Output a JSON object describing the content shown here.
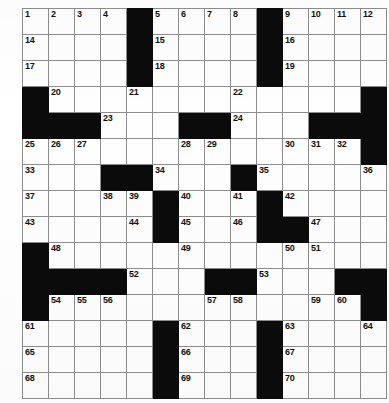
{
  "puzzle": {
    "title": "Crossword Puzzle Grid",
    "type": "crossword",
    "rows": 15,
    "cols": 14,
    "colors": {
      "block": "#0b0b0b",
      "cell": "#fefefe",
      "grid_line": "#8d8d8d",
      "outer_border": "#3a3a3a",
      "number_text": "#101010"
    },
    "max_clue_number": 70,
    "grid": [
      {
        "row": 1,
        "cells": [
          {
            "type": "open",
            "number": "1"
          },
          {
            "type": "open",
            "number": "2"
          },
          {
            "type": "open",
            "number": "3"
          },
          {
            "type": "open",
            "number": "4"
          },
          {
            "type": "block",
            "number": ""
          },
          {
            "type": "open",
            "number": "5"
          },
          {
            "type": "open",
            "number": "6"
          },
          {
            "type": "open",
            "number": "7"
          },
          {
            "type": "open",
            "number": "8"
          },
          {
            "type": "block",
            "number": ""
          },
          {
            "type": "open",
            "number": "9"
          },
          {
            "type": "open",
            "number": "10"
          },
          {
            "type": "open",
            "number": "11"
          },
          {
            "type": "open",
            "number": "12"
          }
        ]
      },
      {
        "row": 2,
        "cells": [
          {
            "type": "open",
            "number": "14"
          },
          {
            "type": "open",
            "number": ""
          },
          {
            "type": "open",
            "number": ""
          },
          {
            "type": "open",
            "number": ""
          },
          {
            "type": "block",
            "number": ""
          },
          {
            "type": "open",
            "number": "15"
          },
          {
            "type": "open",
            "number": ""
          },
          {
            "type": "open",
            "number": ""
          },
          {
            "type": "open",
            "number": ""
          },
          {
            "type": "block",
            "number": ""
          },
          {
            "type": "open",
            "number": "16"
          },
          {
            "type": "open",
            "number": ""
          },
          {
            "type": "open",
            "number": ""
          },
          {
            "type": "open",
            "number": ""
          }
        ]
      },
      {
        "row": 3,
        "cells": [
          {
            "type": "open",
            "number": "17"
          },
          {
            "type": "open",
            "number": ""
          },
          {
            "type": "open",
            "number": ""
          },
          {
            "type": "open",
            "number": ""
          },
          {
            "type": "block",
            "number": ""
          },
          {
            "type": "open",
            "number": "18"
          },
          {
            "type": "open",
            "number": ""
          },
          {
            "type": "open",
            "number": ""
          },
          {
            "type": "open",
            "number": ""
          },
          {
            "type": "block",
            "number": ""
          },
          {
            "type": "open",
            "number": "19"
          },
          {
            "type": "open",
            "number": ""
          },
          {
            "type": "open",
            "number": ""
          },
          {
            "type": "open",
            "number": ""
          }
        ]
      },
      {
        "row": 4,
        "cells": [
          {
            "type": "block",
            "number": ""
          },
          {
            "type": "open",
            "number": "20"
          },
          {
            "type": "open",
            "number": ""
          },
          {
            "type": "open",
            "number": ""
          },
          {
            "type": "open",
            "number": "21"
          },
          {
            "type": "open",
            "number": ""
          },
          {
            "type": "open",
            "number": ""
          },
          {
            "type": "open",
            "number": ""
          },
          {
            "type": "open",
            "number": "22"
          },
          {
            "type": "open",
            "number": ""
          },
          {
            "type": "open",
            "number": ""
          },
          {
            "type": "open",
            "number": ""
          },
          {
            "type": "open",
            "number": ""
          },
          {
            "type": "block",
            "number": ""
          }
        ]
      },
      {
        "row": 5,
        "cells": [
          {
            "type": "block",
            "number": ""
          },
          {
            "type": "block",
            "number": ""
          },
          {
            "type": "block",
            "number": ""
          },
          {
            "type": "open",
            "number": "23"
          },
          {
            "type": "open",
            "number": ""
          },
          {
            "type": "open",
            "number": ""
          },
          {
            "type": "block",
            "number": ""
          },
          {
            "type": "block",
            "number": ""
          },
          {
            "type": "open",
            "number": "24"
          },
          {
            "type": "open",
            "number": ""
          },
          {
            "type": "open",
            "number": ""
          },
          {
            "type": "block",
            "number": ""
          },
          {
            "type": "block",
            "number": ""
          },
          {
            "type": "block",
            "number": ""
          }
        ]
      },
      {
        "row": 6,
        "cells": [
          {
            "type": "open",
            "number": "25"
          },
          {
            "type": "open",
            "number": "26"
          },
          {
            "type": "open",
            "number": "27"
          },
          {
            "type": "open",
            "number": ""
          },
          {
            "type": "open",
            "number": ""
          },
          {
            "type": "open",
            "number": ""
          },
          {
            "type": "open",
            "number": "28"
          },
          {
            "type": "open",
            "number": "29"
          },
          {
            "type": "open",
            "number": ""
          },
          {
            "type": "open",
            "number": ""
          },
          {
            "type": "open",
            "number": "30"
          },
          {
            "type": "open",
            "number": "31"
          },
          {
            "type": "open",
            "number": "32"
          },
          {
            "type": "block",
            "number": ""
          }
        ]
      },
      {
        "row": 7,
        "cells": [
          {
            "type": "open",
            "number": "33"
          },
          {
            "type": "open",
            "number": ""
          },
          {
            "type": "open",
            "number": ""
          },
          {
            "type": "block",
            "number": ""
          },
          {
            "type": "block",
            "number": ""
          },
          {
            "type": "open",
            "number": "34"
          },
          {
            "type": "open",
            "number": ""
          },
          {
            "type": "open",
            "number": ""
          },
          {
            "type": "block",
            "number": ""
          },
          {
            "type": "open",
            "number": "35"
          },
          {
            "type": "open",
            "number": ""
          },
          {
            "type": "open",
            "number": ""
          },
          {
            "type": "open",
            "number": ""
          },
          {
            "type": "open",
            "number": "36"
          }
        ]
      },
      {
        "row": 8,
        "cells": [
          {
            "type": "open",
            "number": "37"
          },
          {
            "type": "open",
            "number": ""
          },
          {
            "type": "open",
            "number": ""
          },
          {
            "type": "open",
            "number": "38"
          },
          {
            "type": "open",
            "number": "39"
          },
          {
            "type": "block",
            "number": ""
          },
          {
            "type": "open",
            "number": "40"
          },
          {
            "type": "open",
            "number": ""
          },
          {
            "type": "open",
            "number": "41"
          },
          {
            "type": "block",
            "number": ""
          },
          {
            "type": "open",
            "number": "42"
          },
          {
            "type": "open",
            "number": ""
          },
          {
            "type": "open",
            "number": ""
          },
          {
            "type": "open",
            "number": ""
          }
        ]
      },
      {
        "row": 9,
        "cells": [
          {
            "type": "open",
            "number": "43"
          },
          {
            "type": "open",
            "number": ""
          },
          {
            "type": "open",
            "number": ""
          },
          {
            "type": "open",
            "number": ""
          },
          {
            "type": "open",
            "number": "44"
          },
          {
            "type": "block",
            "number": ""
          },
          {
            "type": "open",
            "number": "45"
          },
          {
            "type": "open",
            "number": ""
          },
          {
            "type": "open",
            "number": "46"
          },
          {
            "type": "block",
            "number": ""
          },
          {
            "type": "block",
            "number": ""
          },
          {
            "type": "open",
            "number": "47"
          },
          {
            "type": "open",
            "number": ""
          },
          {
            "type": "open",
            "number": ""
          }
        ]
      },
      {
        "row": 10,
        "cells": [
          {
            "type": "block",
            "number": ""
          },
          {
            "type": "open",
            "number": "48"
          },
          {
            "type": "open",
            "number": ""
          },
          {
            "type": "open",
            "number": ""
          },
          {
            "type": "open",
            "number": ""
          },
          {
            "type": "open",
            "number": ""
          },
          {
            "type": "open",
            "number": "49"
          },
          {
            "type": "open",
            "number": ""
          },
          {
            "type": "open",
            "number": ""
          },
          {
            "type": "open",
            "number": ""
          },
          {
            "type": "open",
            "number": "50"
          },
          {
            "type": "open",
            "number": "51"
          },
          {
            "type": "open",
            "number": ""
          },
          {
            "type": "open",
            "number": ""
          }
        ]
      },
      {
        "row": 11,
        "cells": [
          {
            "type": "block",
            "number": ""
          },
          {
            "type": "block",
            "number": ""
          },
          {
            "type": "block",
            "number": ""
          },
          {
            "type": "block",
            "number": ""
          },
          {
            "type": "open",
            "number": "52"
          },
          {
            "type": "open",
            "number": ""
          },
          {
            "type": "open",
            "number": ""
          },
          {
            "type": "block",
            "number": ""
          },
          {
            "type": "block",
            "number": ""
          },
          {
            "type": "open",
            "number": "53"
          },
          {
            "type": "open",
            "number": ""
          },
          {
            "type": "open",
            "number": ""
          },
          {
            "type": "block",
            "number": ""
          },
          {
            "type": "block",
            "number": ""
          }
        ]
      },
      {
        "row": 12,
        "cells": [
          {
            "type": "block",
            "number": ""
          },
          {
            "type": "open",
            "number": "54"
          },
          {
            "type": "open",
            "number": "55"
          },
          {
            "type": "open",
            "number": "56"
          },
          {
            "type": "open",
            "number": ""
          },
          {
            "type": "open",
            "number": ""
          },
          {
            "type": "open",
            "number": ""
          },
          {
            "type": "open",
            "number": "57"
          },
          {
            "type": "open",
            "number": "58"
          },
          {
            "type": "open",
            "number": ""
          },
          {
            "type": "open",
            "number": ""
          },
          {
            "type": "open",
            "number": "59"
          },
          {
            "type": "open",
            "number": "60"
          },
          {
            "type": "block",
            "number": ""
          }
        ]
      },
      {
        "row": 13,
        "cells": [
          {
            "type": "open",
            "number": "61"
          },
          {
            "type": "open",
            "number": ""
          },
          {
            "type": "open",
            "number": ""
          },
          {
            "type": "open",
            "number": ""
          },
          {
            "type": "open",
            "number": ""
          },
          {
            "type": "block",
            "number": ""
          },
          {
            "type": "open",
            "number": "62"
          },
          {
            "type": "open",
            "number": ""
          },
          {
            "type": "open",
            "number": ""
          },
          {
            "type": "block",
            "number": ""
          },
          {
            "type": "open",
            "number": "63"
          },
          {
            "type": "open",
            "number": ""
          },
          {
            "type": "open",
            "number": ""
          },
          {
            "type": "open",
            "number": "64"
          }
        ]
      },
      {
        "row": 14,
        "cells": [
          {
            "type": "open",
            "number": "65"
          },
          {
            "type": "open",
            "number": ""
          },
          {
            "type": "open",
            "number": ""
          },
          {
            "type": "open",
            "number": ""
          },
          {
            "type": "open",
            "number": ""
          },
          {
            "type": "block",
            "number": ""
          },
          {
            "type": "open",
            "number": "66"
          },
          {
            "type": "open",
            "number": ""
          },
          {
            "type": "open",
            "number": ""
          },
          {
            "type": "block",
            "number": ""
          },
          {
            "type": "open",
            "number": "67"
          },
          {
            "type": "open",
            "number": ""
          },
          {
            "type": "open",
            "number": ""
          },
          {
            "type": "open",
            "number": ""
          }
        ]
      },
      {
        "row": 15,
        "cells": [
          {
            "type": "open",
            "number": "68"
          },
          {
            "type": "open",
            "number": ""
          },
          {
            "type": "open",
            "number": ""
          },
          {
            "type": "open",
            "number": ""
          },
          {
            "type": "open",
            "number": ""
          },
          {
            "type": "block",
            "number": ""
          },
          {
            "type": "open",
            "number": "69"
          },
          {
            "type": "open",
            "number": ""
          },
          {
            "type": "open",
            "number": ""
          },
          {
            "type": "block",
            "number": ""
          },
          {
            "type": "open",
            "number": "70"
          },
          {
            "type": "open",
            "number": ""
          },
          {
            "type": "open",
            "number": ""
          },
          {
            "type": "open",
            "number": ""
          }
        ]
      }
    ]
  }
}
